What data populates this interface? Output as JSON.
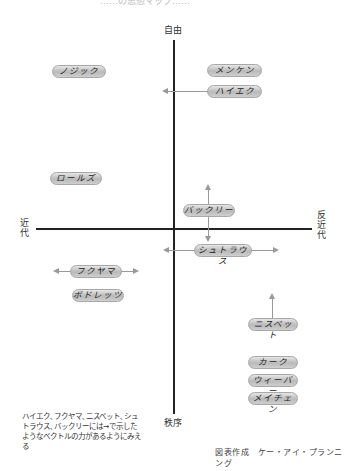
{
  "title_fragment": "……の思想マップ……",
  "axes": {
    "top": "自由",
    "bottom": "秩序",
    "left": "近代",
    "right": "反近代"
  },
  "thinkers": [
    {
      "name": "ノジック",
      "x": 52,
      "y": 65,
      "w": 54
    },
    {
      "name": "メンケン",
      "x": 207,
      "y": 64,
      "w": 55
    },
    {
      "name": "ハイエク",
      "x": 207,
      "y": 85,
      "w": 55
    },
    {
      "name": "ロールズ",
      "x": 50,
      "y": 172,
      "w": 52
    },
    {
      "name": "バックリー",
      "x": 183,
      "y": 204,
      "w": 52
    },
    {
      "name": "シュトラウス",
      "x": 194,
      "y": 244,
      "w": 58
    },
    {
      "name": "フクヤマ",
      "x": 70,
      "y": 265,
      "w": 52
    },
    {
      "name": "ボドレッツ",
      "x": 72,
      "y": 289,
      "w": 52
    },
    {
      "name": "ニスベット",
      "x": 248,
      "y": 318,
      "w": 50
    },
    {
      "name": "カーク",
      "x": 248,
      "y": 356,
      "w": 50
    },
    {
      "name": "ウィーバー",
      "x": 248,
      "y": 374,
      "w": 50
    },
    {
      "name": "メイチェン",
      "x": 248,
      "y": 392,
      "w": 50
    }
  ],
  "vectors": [
    {
      "thinker": "ハイエク",
      "directions": [
        "left",
        "right"
      ]
    },
    {
      "thinker": "バックリー",
      "directions": [
        "up",
        "down"
      ]
    },
    {
      "thinker": "シュトラウス",
      "directions": [
        "left",
        "right"
      ]
    },
    {
      "thinker": "フクヤマ",
      "directions": [
        "left",
        "right"
      ]
    },
    {
      "thinker": "ニスベット",
      "directions": [
        "up"
      ]
    }
  ],
  "note": "ハイエク､フクヤマ､ニスベット､シュトラウス､バックリーには→で示したようなベクトルの力があるようにみえる",
  "credit": "図表作成　ケー・アイ・プランニング"
}
